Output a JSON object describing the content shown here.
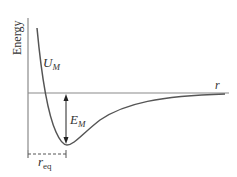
{
  "diagram": {
    "y_axis_label": "Energy",
    "x_axis_label": "r",
    "curve_label": {
      "main": "U",
      "sub": "M"
    },
    "depth_label": {
      "main": "E",
      "sub": "M"
    },
    "equilibrium_label": {
      "main": "r",
      "sub": "eq"
    },
    "colors": {
      "axis": "#8a8a8a",
      "curve": "#555555",
      "arrow": "#222222",
      "text": "#333333"
    }
  }
}
